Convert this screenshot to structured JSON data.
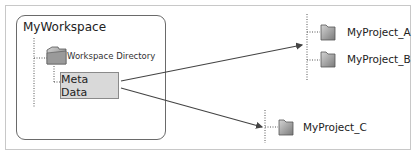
{
  "diagram": {
    "workspace": {
      "title": "MyWorkspace",
      "directory_label": "Workspace Directory",
      "meta_box_label": "Meta Data"
    },
    "projects": [
      {
        "label": "MyProject_A"
      },
      {
        "label": "MyProject_B"
      },
      {
        "label": "MyProject_C"
      }
    ],
    "edges": [
      {
        "from": "Meta Data",
        "to": "MyProject_A / MyProject_B group"
      },
      {
        "from": "Meta Data",
        "to": "MyProject_C"
      }
    ],
    "colors": {
      "meta_fill": "#d9d9d9",
      "folder_fill": "#9a9a9a",
      "line": "#444444"
    }
  }
}
